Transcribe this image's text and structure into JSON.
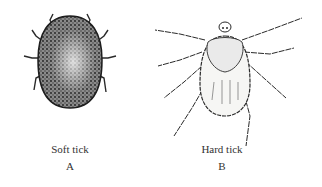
{
  "figure": {
    "panels": [
      {
        "id": "A",
        "label": "Soft tick",
        "letter": "A",
        "illustration": "soft-tick-drawing"
      },
      {
        "id": "B",
        "label": "Hard tick",
        "letter": "B",
        "illustration": "hard-tick-drawing"
      }
    ],
    "colors": {
      "ink": "#2a2a2a",
      "background": "#ffffff",
      "text": "#333333"
    }
  }
}
